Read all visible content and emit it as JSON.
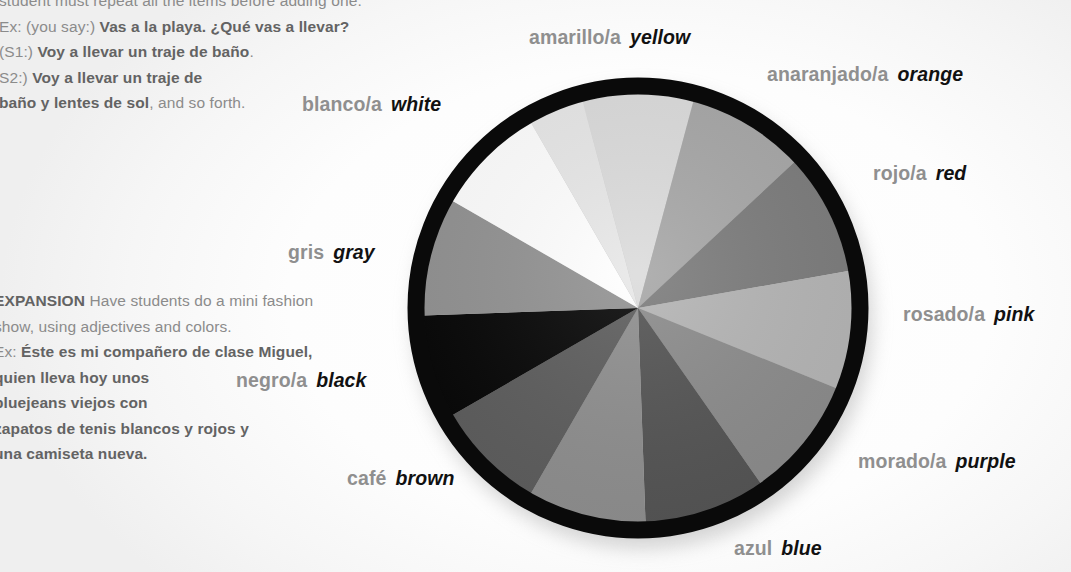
{
  "page": {
    "background_color": "#ffffff"
  },
  "left_text": {
    "top_block": {
      "clipped_line": "you say a category and students name items; each",
      "lines": [
        [
          {
            "text": "student must repeat all the items before adding one.",
            "bold": false
          }
        ],
        [
          {
            "text": "Ex: (you say:) ",
            "bold": false
          },
          {
            "text": "Vas a la playa. ¿Qué vas a llevar?",
            "bold": true
          }
        ],
        [
          {
            "text": "(S1:) ",
            "bold": false
          },
          {
            "text": "Voy a llevar un traje de baño",
            "bold": true
          },
          {
            "text": ".",
            "bold": false
          }
        ],
        [
          {
            "text": "S2:) ",
            "bold": false
          },
          {
            "text": "Voy a llevar un traje de",
            "bold": true
          }
        ],
        [
          {
            "text": "baño y lentes de sol",
            "bold": true
          },
          {
            "text": ", and so forth.",
            "bold": false
          }
        ]
      ]
    },
    "bottom_block": {
      "lines": [
        [
          {
            "text": "EXPANSION",
            "bold": true
          },
          {
            "text": " Have students do a mini fashion",
            "bold": false
          }
        ],
        [
          {
            "text": "show, using adjectives and colors.",
            "bold": false
          }
        ],
        [
          {
            "text": "Ex: ",
            "bold": false
          },
          {
            "text": "Éste es mi compañero de clase Miguel,",
            "bold": true
          }
        ],
        [
          {
            "text": "quien lleva hoy unos",
            "bold": true
          }
        ],
        [
          {
            "text": "bluejeans viejos con",
            "bold": true
          }
        ],
        [
          {
            "text": "zapatos de tenis blancos y rojos y",
            "bold": true
          }
        ],
        [
          {
            "text": "una camiseta nueva.",
            "bold": true
          }
        ]
      ]
    }
  },
  "chart_data": {
    "type": "pie",
    "title": "",
    "legend_position": "around-pie",
    "grid": false,
    "center_x": 238,
    "center_y": 238,
    "radius": 222,
    "ring_color": "#0a0a0a",
    "ring_width": 17,
    "categories": [
      "amarillo/a",
      "anaranjado/a",
      "rojo/a",
      "rosado/a",
      "morado/a",
      "azul",
      "café",
      "negro/a",
      "gris",
      "blanco/a"
    ],
    "values": [
      30,
      30,
      30,
      30,
      30,
      30,
      30,
      30,
      30,
      60
    ],
    "slices": [
      {
        "name": "amarillo/a",
        "english": "yellow",
        "start_deg": -15,
        "end_deg": 15,
        "fill": "#dcdcdc"
      },
      {
        "name": "anaranjado/a",
        "english": "orange",
        "start_deg": 15,
        "end_deg": 47,
        "fill": "#a8a8a8"
      },
      {
        "name": "rojo/a",
        "english": "red",
        "start_deg": 47,
        "end_deg": 80,
        "fill": "#7d7d7d"
      },
      {
        "name": "rosado/a",
        "english": "pink",
        "start_deg": 80,
        "end_deg": 112,
        "fill": "#b5b5b5"
      },
      {
        "name": "morado/a",
        "english": "purple",
        "start_deg": 112,
        "end_deg": 145,
        "fill": "#8c8c8c"
      },
      {
        "name": "azul",
        "english": "blue",
        "start_deg": 145,
        "end_deg": 178,
        "fill": "#555555"
      },
      {
        "name": "café",
        "english": "brown",
        "start_deg": 178,
        "end_deg": 210,
        "fill": "#8f8f8f"
      },
      {
        "name": "café-2",
        "english": "brown",
        "start_deg": 210,
        "end_deg": 240,
        "fill": "#5e5e5e"
      },
      {
        "name": "negro/a",
        "english": "black",
        "start_deg": 240,
        "end_deg": 268,
        "fill": "#080808"
      },
      {
        "name": "gris",
        "english": "gray",
        "start_deg": 268,
        "end_deg": 300,
        "fill": "#939393"
      },
      {
        "name": "blanco/a",
        "english": "white",
        "start_deg": 300,
        "end_deg": 330,
        "fill": "#ffffff"
      },
      {
        "name": "blanco-2",
        "english": "white",
        "start_deg": 330,
        "end_deg": 345,
        "fill": "#e8e8e8"
      }
    ],
    "xlabel": "",
    "ylabel": ""
  },
  "labels": [
    {
      "id": "amarillo",
      "es": "amarillo/a",
      "en": "yellow",
      "left": 529,
      "top": 27
    },
    {
      "id": "anaranjado",
      "es": "anaranjado/a",
      "en": "orange",
      "left": 767,
      "top": 64
    },
    {
      "id": "rojo",
      "es": "rojo/a",
      "en": "red",
      "left": 873,
      "top": 163
    },
    {
      "id": "rosado",
      "es": "rosado/a",
      "en": "pink",
      "left": 903,
      "top": 304
    },
    {
      "id": "morado",
      "es": "morado/a",
      "en": "purple",
      "left": 858,
      "top": 451
    },
    {
      "id": "azul",
      "es": "azul",
      "en": "blue",
      "left": 734,
      "top": 538
    },
    {
      "id": "cafe",
      "es": "café",
      "en": "brown",
      "left": 347,
      "top": 468
    },
    {
      "id": "negro",
      "es": "negro/a",
      "en": "black",
      "left": 236,
      "top": 370
    },
    {
      "id": "gris",
      "es": "gris",
      "en": "gray",
      "left": 288,
      "top": 242
    },
    {
      "id": "blanco",
      "es": "blanco/a",
      "en": "white",
      "left": 302,
      "top": 94
    }
  ]
}
